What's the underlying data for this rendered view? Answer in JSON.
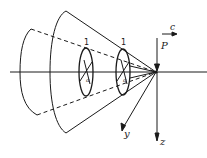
{
  "diagram": {
    "labels": {
      "force": "P",
      "velocity": "c",
      "axis_y": "y",
      "axis_z": "z",
      "section_1": "1",
      "section_2": "1",
      "marker_1": "a",
      "marker_2": "a"
    },
    "colors": {
      "line": "#1a1a1a",
      "background": "#ffffff"
    }
  }
}
